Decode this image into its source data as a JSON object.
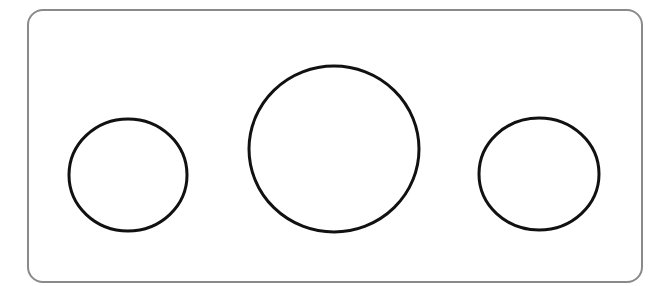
{
  "diagram": {
    "frame": {
      "x": 28,
      "y": 10,
      "width": 614,
      "height": 272,
      "rx": 15,
      "stroke": "#8a8a8a",
      "stroke_width": 2
    },
    "circles": [
      {
        "name": "left-circle",
        "cx": 128,
        "cy": 175,
        "rx": 59,
        "ry": 56,
        "stroke": "#111111",
        "stroke_width": 3
      },
      {
        "name": "center-circle",
        "cx": 334,
        "cy": 149,
        "rx": 85,
        "ry": 83,
        "stroke": "#111111",
        "stroke_width": 3
      },
      {
        "name": "right-circle",
        "cx": 539,
        "cy": 174,
        "rx": 60,
        "ry": 56,
        "stroke": "#111111",
        "stroke_width": 3
      }
    ]
  }
}
